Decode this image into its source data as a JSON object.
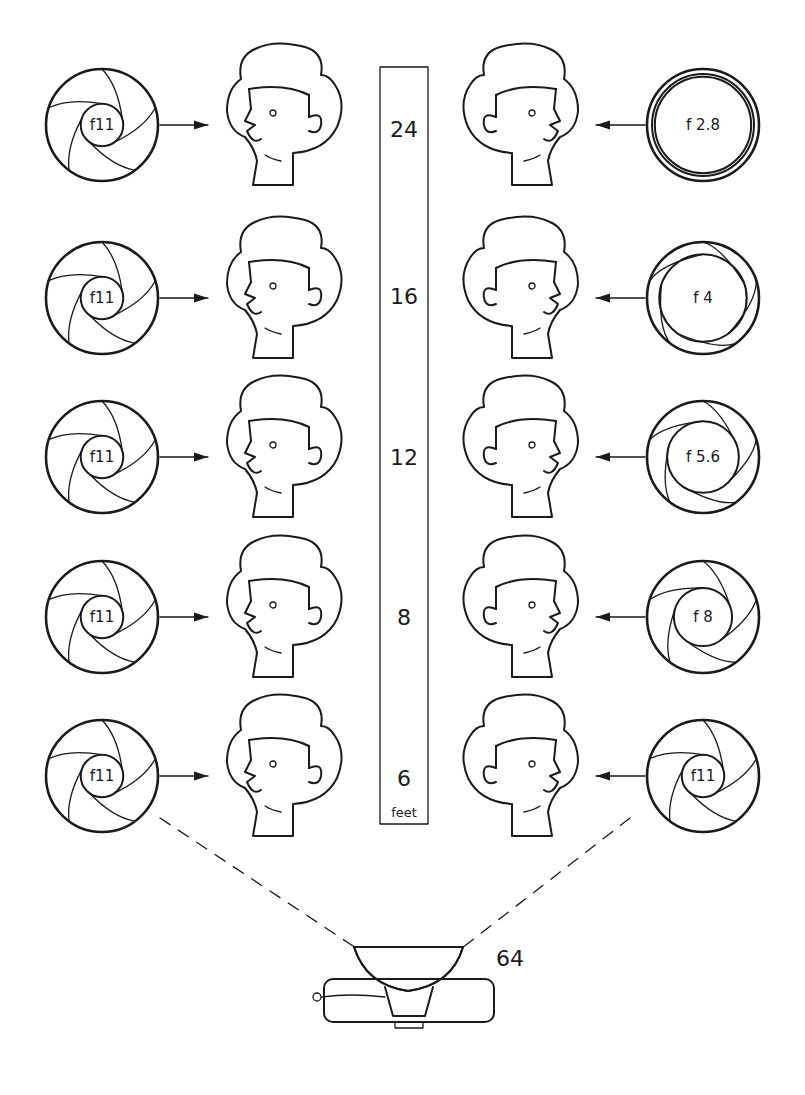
{
  "diagram": {
    "title": "",
    "colors": {
      "ink": "#1a1a1a",
      "background": "#ffffff",
      "dark_fill": "#1c1c1c",
      "stipple": "#555555"
    },
    "scale": {
      "unit_label": "feet",
      "distances": [
        "24",
        "16",
        "12",
        "8",
        "6"
      ]
    },
    "flash": {
      "label": "64",
      "icon": "flash-unit-icon"
    },
    "rows": [
      {
        "distance": "24",
        "left_aperture": "f11",
        "left_face_exposure": "heavily-overexposed",
        "right_aperture": "f 2.8",
        "right_face_exposure": "correct"
      },
      {
        "distance": "16",
        "left_aperture": "f11",
        "left_face_exposure": "overexposed",
        "right_aperture": "f 4",
        "right_face_exposure": "correct"
      },
      {
        "distance": "12",
        "left_aperture": "f11",
        "left_face_exposure": "slightly-overexposed",
        "right_aperture": "f 5.6",
        "right_face_exposure": "correct"
      },
      {
        "distance": "8",
        "left_aperture": "f11",
        "left_face_exposure": "slightly-overexposed",
        "right_aperture": "f 8",
        "right_face_exposure": "correct"
      },
      {
        "distance": "6",
        "left_aperture": "f11",
        "left_face_exposure": "correct",
        "right_aperture": "f11",
        "right_face_exposure": "correct"
      }
    ]
  }
}
